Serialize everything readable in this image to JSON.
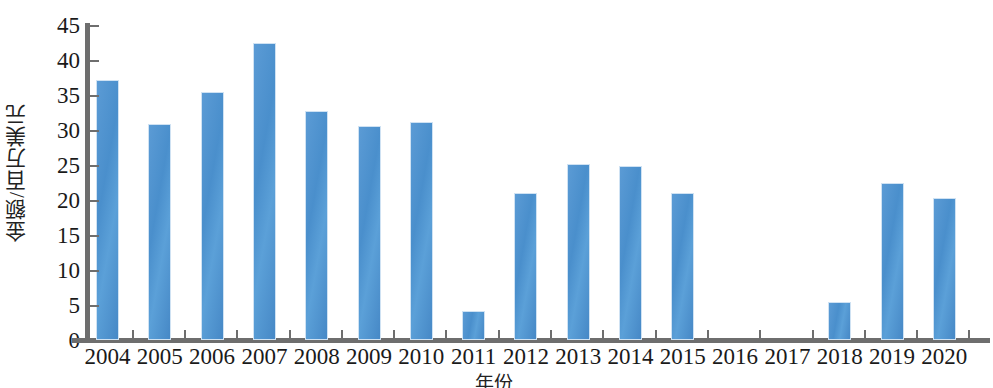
{
  "chart_data": {
    "type": "bar",
    "title": "",
    "subtitle": "",
    "xlabel": "年份",
    "ylabel": "金额/百万美元",
    "categories": [
      "2004",
      "2005",
      "2006",
      "2007",
      "2008",
      "2009",
      "2010",
      "2011",
      "2012",
      "2013",
      "2014",
      "2015",
      "2016",
      "2017",
      "2018",
      "2019",
      "2020"
    ],
    "values": [
      37.2,
      30.8,
      35.4,
      42.5,
      32.7,
      30.6,
      31.2,
      4.1,
      21.0,
      25.2,
      24.8,
      21.0,
      0,
      0,
      5.4,
      22.4,
      20.3
    ],
    "ylim": [
      0,
      45
    ],
    "xlim_note": "categorical",
    "y_ticks": [
      0,
      5,
      10,
      15,
      20,
      25,
      30,
      35,
      40,
      45
    ],
    "y_tick_labels": [
      "0",
      "5",
      "10",
      "15",
      "20",
      "25",
      "30",
      "35",
      "40",
      "45"
    ],
    "grid": false,
    "legend": null,
    "legend_position": "none",
    "series": [
      {
        "name": "金额",
        "color": "#4A8FCC",
        "values": [
          37.2,
          30.8,
          35.4,
          42.5,
          32.7,
          30.6,
          31.2,
          4.1,
          21.0,
          25.2,
          24.8,
          21.0,
          0,
          0,
          5.4,
          22.4,
          20.3
        ]
      }
    ],
    "annotations": []
  },
  "colors": {
    "bar_fill": "#4A8FCC",
    "bar_edge": "#CFE2F3",
    "axis": "#6E6E6E",
    "text": "#1A1A1A",
    "background": "#FFFFFF"
  }
}
